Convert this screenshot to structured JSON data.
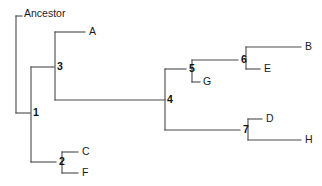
{
  "figure": {
    "type": "phylogenetic-cladogram",
    "background_color": "#ffffff",
    "line_color": "#4a4a4a",
    "text_color": "#1a1a1a"
  },
  "root": {
    "label": "Ancestor",
    "x": 24,
    "y": 14
  },
  "internal_nodes": [
    {
      "id": "1",
      "label": "1",
      "x": 33,
      "y": 113
    },
    {
      "id": "2",
      "label": "2",
      "x": 59,
      "y": 162
    },
    {
      "id": "3",
      "label": "3",
      "x": 57,
      "y": 67
    },
    {
      "id": "4",
      "label": "4",
      "x": 167,
      "y": 100
    },
    {
      "id": "5",
      "label": "5",
      "x": 189,
      "y": 69
    },
    {
      "id": "6",
      "label": "6",
      "x": 241,
      "y": 60
    },
    {
      "id": "7",
      "label": "7",
      "x": 243,
      "y": 130
    }
  ],
  "leaves": [
    {
      "id": "A",
      "label": "A",
      "x": 89,
      "y": 32
    },
    {
      "id": "C",
      "label": "C",
      "x": 82,
      "y": 152
    },
    {
      "id": "F",
      "label": "F",
      "x": 82,
      "y": 173
    },
    {
      "id": "G",
      "label": "G",
      "x": 203,
      "y": 82
    },
    {
      "id": "B",
      "label": "B",
      "x": 305,
      "y": 47
    },
    {
      "id": "E",
      "label": "E",
      "x": 264,
      "y": 69
    },
    {
      "id": "D",
      "label": "D",
      "x": 266,
      "y": 119
    },
    {
      "id": "H",
      "label": "H",
      "x": 305,
      "y": 140
    }
  ],
  "branches": [
    {
      "name": "root-stem-horizontal",
      "points": "16,16 22,16"
    },
    {
      "name": "root-stem-vertical",
      "points": "16,16 16,113"
    },
    {
      "name": "root-to-node1",
      "points": "16,113 30,113"
    },
    {
      "name": "node1-vertical",
      "points": "31,67 31,162"
    },
    {
      "name": "node1-to-node3",
      "points": "31,67 54,67"
    },
    {
      "name": "node1-to-node2",
      "points": "31,162 56,162"
    },
    {
      "name": "node3-vertical",
      "points": "55,32 55,100"
    },
    {
      "name": "node3-to-leafA",
      "points": "55,32 85,32"
    },
    {
      "name": "node3-to-node4",
      "points": "55,100 165,100"
    },
    {
      "name": "node2-vertical",
      "points": "62,152 62,173"
    },
    {
      "name": "node2-to-leafC",
      "points": "62,152 78,152"
    },
    {
      "name": "node2-to-leafF",
      "points": "62,173 78,173"
    },
    {
      "name": "node4-vertical",
      "points": "165,69 165,130"
    },
    {
      "name": "node4-to-node5",
      "points": "165,69 186,69"
    },
    {
      "name": "node4-to-node7",
      "points": "165,130 240,130"
    },
    {
      "name": "node5-vertical",
      "points": "192,60 192,82"
    },
    {
      "name": "node5-to-node6",
      "points": "192,60 238,60"
    },
    {
      "name": "node5-to-leafG",
      "points": "192,82 200,82"
    },
    {
      "name": "node6-vertical",
      "points": "246,47 246,69"
    },
    {
      "name": "node6-to-leafB",
      "points": "246,47 301,47"
    },
    {
      "name": "node6-to-leafE",
      "points": "246,69 260,69"
    },
    {
      "name": "node7-vertical",
      "points": "248,119 248,140"
    },
    {
      "name": "node7-to-leafD",
      "points": "248,119 262,119"
    },
    {
      "name": "node7-to-leafH",
      "points": "248,140 301,140"
    }
  ],
  "topology": {
    "newick": "(((A,(( (B,E)6,G)5... ))))",
    "description": "Ancestor -> 1; 1 splits into 3 and 2; 3 splits into A and 4; 4 splits into 5 and 7; 5 splits into 6 and G; 6 splits into B and E; 7 splits into D and H; 2 splits into C and F"
  }
}
